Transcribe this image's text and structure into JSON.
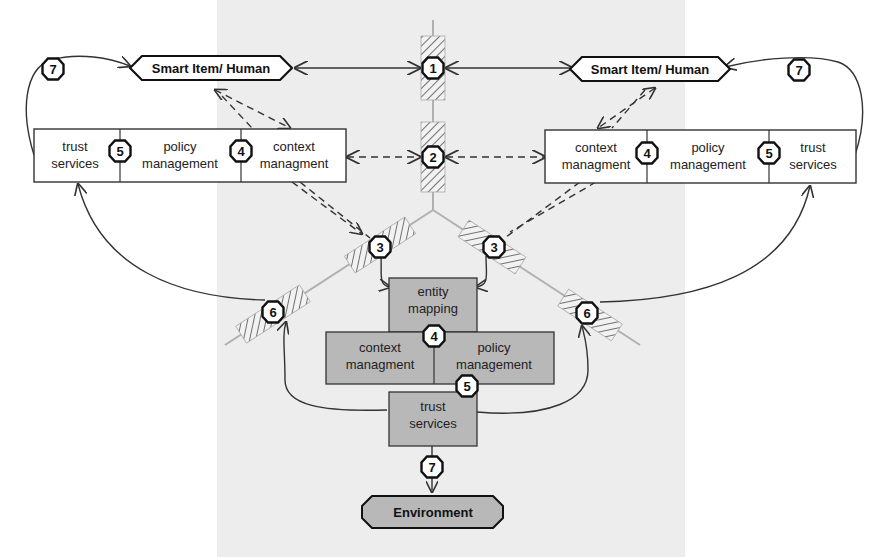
{
  "colors": {
    "background": "#ffffff",
    "texture": "#ededed",
    "box_white": "#ffffff",
    "box_gray": "#b8b8b8",
    "stroke": "#333333",
    "axis": "#b0b0b0",
    "hatch": "#777777"
  },
  "nodes": {
    "left_actor": "Smart Item/ Human",
    "right_actor": "Smart Item/ Human",
    "environment": "Environment"
  },
  "left_panel": {
    "trust": [
      "trust",
      "services"
    ],
    "policy": [
      "policy",
      "management"
    ],
    "context": [
      "context",
      "managment"
    ]
  },
  "right_panel": {
    "context": [
      "context",
      "managment"
    ],
    "policy": [
      "policy",
      "management"
    ],
    "trust": [
      "trust",
      "services"
    ]
  },
  "center_stack": {
    "entity": [
      "entity",
      "mapping"
    ],
    "context": [
      "context",
      "managment"
    ],
    "policy": [
      "policy",
      "management"
    ],
    "trust": [
      "trust",
      "services"
    ]
  },
  "badges": {
    "b1": "1",
    "b2": "2",
    "b3_left": "3",
    "b3_right": "3",
    "b4_left": "4",
    "b4_right": "4",
    "b4_center": "4",
    "b5_left": "5",
    "b5_right": "5",
    "b5_center": "5",
    "b6_left": "6",
    "b6_right": "6",
    "b7_left": "7",
    "b7_right": "7",
    "b7_center": "7"
  }
}
